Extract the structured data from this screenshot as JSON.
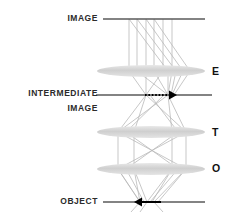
{
  "diagram": {
    "background_color": "#ffffff",
    "line_color": "#555555",
    "ray_color": "#b8b8b8",
    "lens_color": "#d6d6d6",
    "text_color": "#2b2b2b",
    "arrow_color": "#000000",
    "left_labels": [
      {
        "id": "image",
        "text": "IMAGE",
        "y": 19
      },
      {
        "id": "intermediate",
        "text": "INTERMEDIATE",
        "y": 94
      },
      {
        "id": "intermediate_image",
        "text": "IMAGE",
        "y": 109
      },
      {
        "id": "object",
        "text": "OBJECT",
        "y": 202
      }
    ],
    "right_labels": [
      {
        "id": "eyepiece",
        "text": "E",
        "y": 71
      },
      {
        "id": "tube-lens",
        "text": "T",
        "y": 132
      },
      {
        "id": "objective",
        "text": "O",
        "y": 169
      }
    ],
    "planes": [
      {
        "id": "image-plane",
        "label": "IMAGE",
        "y": 19,
        "x1": 103,
        "x2": 205
      },
      {
        "id": "intermediate-image-plane",
        "label": "INTERMEDIATE IMAGE",
        "y": 95,
        "x1": 96,
        "x2": 212
      },
      {
        "id": "object-plane",
        "label": "OBJECT",
        "y": 202,
        "x1": 103,
        "x2": 205
      }
    ],
    "lenses": [
      {
        "id": "lens-e",
        "label": "E",
        "cx": 151,
        "cy": 71,
        "rx": 54,
        "ry": 6
      },
      {
        "id": "lens-t",
        "label": "T",
        "cx": 151,
        "cy": 132,
        "rx": 54,
        "ry": 6
      },
      {
        "id": "lens-o",
        "label": "O",
        "cx": 151,
        "cy": 169,
        "rx": 54,
        "ry": 6
      }
    ],
    "arrows": [
      {
        "id": "intermediate-image-arrow",
        "direction": "right",
        "style": "dotted",
        "x1": 145,
        "x2": 176,
        "y": 95
      },
      {
        "id": "object-arrow",
        "direction": "left",
        "style": "solid",
        "x1": 161,
        "x2": 136,
        "y": 202
      }
    ]
  }
}
